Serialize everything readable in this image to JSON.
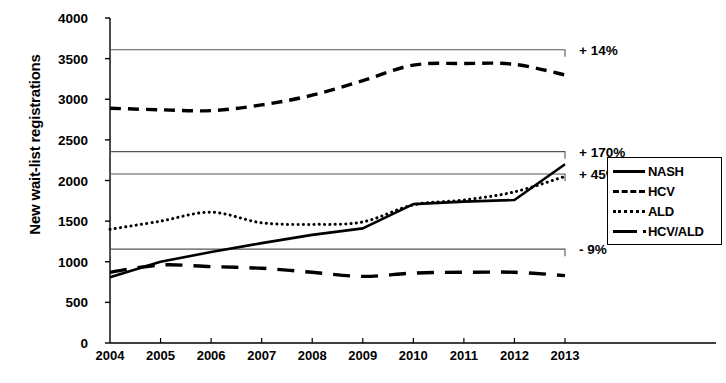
{
  "chart_data": {
    "type": "line",
    "title": "",
    "xlabel": "",
    "ylabel": "New wait-list registrations",
    "categories": [
      2004,
      2005,
      2006,
      2007,
      2008,
      2009,
      2010,
      2011,
      2012,
      2013
    ],
    "xticklabels": [
      "2004",
      "2005",
      "2006",
      "2007",
      "2008",
      "2009",
      "2010",
      "2011",
      "2012",
      "2013"
    ],
    "yticklabels": [
      "0",
      "500",
      "1000",
      "1500",
      "2000",
      "2500",
      "3000",
      "3500",
      "4000"
    ],
    "ylim": [
      0,
      4000
    ],
    "ytick_step": 500,
    "grid": false,
    "legend_position": "right",
    "series": [
      {
        "name": "NASH",
        "style": "solid",
        "values": [
          810,
          1000,
          1120,
          1230,
          1330,
          1410,
          1710,
          1740,
          1760,
          2200
        ]
      },
      {
        "name": "HCV",
        "style": "dashed",
        "values": [
          2890,
          2870,
          2860,
          2930,
          3050,
          3230,
          3420,
          3440,
          3430,
          3300
        ]
      },
      {
        "name": "ALD",
        "style": "dotted",
        "values": [
          1400,
          1500,
          1610,
          1480,
          1460,
          1490,
          1700,
          1760,
          1860,
          2050
        ]
      },
      {
        "name": "HCV/ALD",
        "style": "long-dash",
        "values": [
          870,
          960,
          940,
          920,
          870,
          820,
          860,
          870,
          870,
          830
        ]
      }
    ],
    "annotations": [
      {
        "label": "+ 14%",
        "series": "HCV",
        "value": 3610,
        "span": [
          2004,
          2013
        ]
      },
      {
        "label": "+ 170%",
        "series": "NASH",
        "value": 2355,
        "span": [
          2004,
          2013
        ]
      },
      {
        "label": "+ 45%",
        "series": "ALD",
        "value": 2080,
        "span": [
          2004,
          2013
        ]
      },
      {
        "label": "- 9%",
        "series": "HCV/ALD",
        "value": 1155,
        "span": [
          2004,
          2013
        ]
      }
    ]
  },
  "legend": {
    "items": [
      {
        "label": "NASH"
      },
      {
        "label": "HCV"
      },
      {
        "label": "ALD"
      },
      {
        "label": "HCV/ALD"
      }
    ]
  }
}
